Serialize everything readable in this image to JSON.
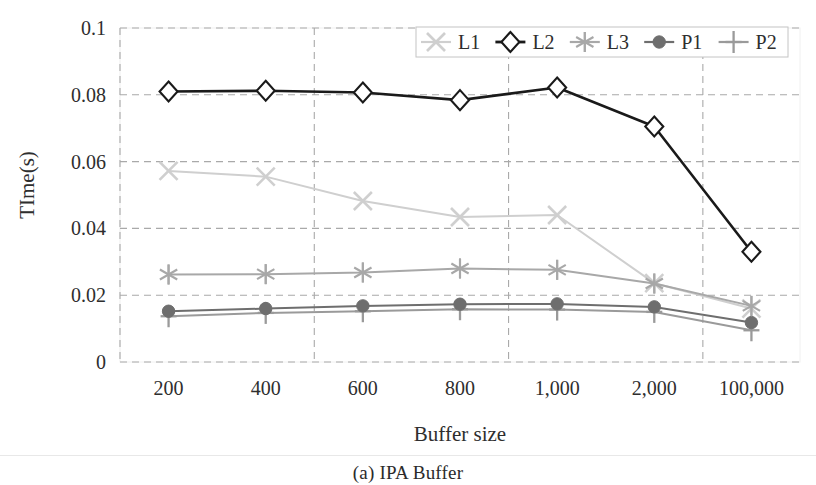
{
  "figure": {
    "caption": "(a) IPA Buffer"
  },
  "chart_data": {
    "type": "line",
    "title": "",
    "xlabel": "Buffer size",
    "ylabel": "TIme(s)",
    "categories": [
      "200",
      "400",
      "600",
      "800",
      "1,000",
      "2,000",
      "100,000"
    ],
    "ylim": [
      0,
      0.1
    ],
    "yticks": [
      "0",
      "0.02",
      "0.04",
      "0.06",
      "0.08",
      "0.1"
    ],
    "ytick_values": [
      0,
      0.02,
      0.04,
      0.06,
      0.08,
      0.1
    ],
    "grid": "dashed-both",
    "legend_position": "top-right",
    "series": [
      {
        "name": "L1",
        "marker": "x-cross",
        "color": "#cfcfcf",
        "values": [
          0.0572,
          0.0555,
          0.0482,
          0.0434,
          0.044,
          0.0236,
          0.016
        ]
      },
      {
        "name": "L2",
        "marker": "diamond-open",
        "color": "#1a1a1a",
        "values": [
          0.081,
          0.0812,
          0.0807,
          0.0784,
          0.0822,
          0.0705,
          0.033
        ]
      },
      {
        "name": "L3",
        "marker": "asterisk",
        "color": "#a8a8a8",
        "values": [
          0.0262,
          0.0263,
          0.0268,
          0.028,
          0.0276,
          0.0235,
          0.0168
        ]
      },
      {
        "name": "P1",
        "marker": "circle-filled",
        "color": "#6e6e6e",
        "values": [
          0.0152,
          0.016,
          0.0168,
          0.0173,
          0.0174,
          0.0165,
          0.0118
        ]
      },
      {
        "name": "P2",
        "marker": "plus",
        "color": "#9a9a9a",
        "values": [
          0.0137,
          0.0147,
          0.0152,
          0.0158,
          0.0157,
          0.015,
          0.0095
        ]
      }
    ]
  }
}
